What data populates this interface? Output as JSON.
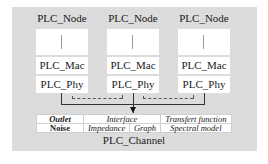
{
  "diagram": {
    "nodes": [
      {
        "title": "PLC_Node",
        "mac": "PLC_Mac",
        "phy": "PLC_Phy"
      },
      {
        "title": "PLC_Node",
        "mac": "PLC_Mac",
        "phy": "PLC_Phy"
      },
      {
        "title": "PLC_Node",
        "mac": "PLC_Mac",
        "phy": "PLC_Phy"
      }
    ],
    "channel": {
      "title": "PLC_Channel",
      "rows": [
        [
          "Outlet",
          "Interface",
          "Transfert function"
        ],
        [
          "Noise",
          "Impedance",
          "Graph",
          "Spectral model"
        ]
      ]
    },
    "colors": {
      "panel": "#dcdcdc",
      "box": "#ffffff",
      "line": "#333333"
    }
  }
}
